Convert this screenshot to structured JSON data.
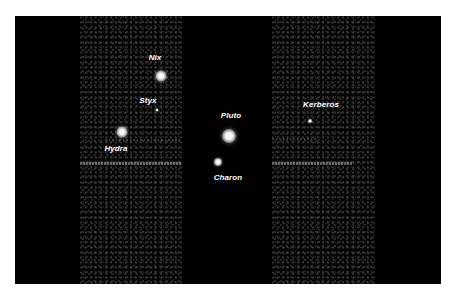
{
  "image": {
    "description": "Telescope image of Pluto and its moons with labeled bodies",
    "background_color": "#000000",
    "frame_color": "#ffffff"
  },
  "bodies": [
    {
      "name": "Nix",
      "label": "Nix",
      "x": 161,
      "y": 76,
      "size": 11,
      "label_x": 155,
      "label_y": 57
    },
    {
      "name": "Styx",
      "label": "Styx",
      "x": 157,
      "y": 110,
      "size": 3,
      "label_x": 148,
      "label_y": 100
    },
    {
      "name": "Hydra",
      "label": "Hydra",
      "x": 122,
      "y": 132,
      "size": 11,
      "label_x": 116,
      "label_y": 148
    },
    {
      "name": "Pluto",
      "label": "Pluto",
      "x": 229,
      "y": 136,
      "size": 14,
      "label_x": 231,
      "label_y": 115
    },
    {
      "name": "Charon",
      "label": "Charon",
      "x": 218,
      "y": 162,
      "size": 8,
      "label_x": 228,
      "label_y": 177
    },
    {
      "name": "Kerberos",
      "label": "Kerberos",
      "x": 310,
      "y": 121,
      "size": 4,
      "label_x": 321,
      "label_y": 104
    }
  ]
}
